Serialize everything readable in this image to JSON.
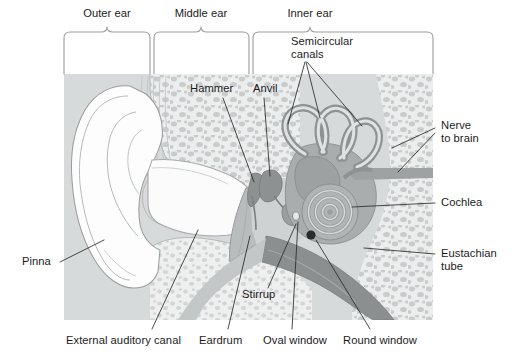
{
  "figure": {
    "background_color": "#ffffff",
    "panel_color": "#d9dcdc",
    "bone_color": "#e3e5e5",
    "tissue_color": "#a8abab",
    "dark_tissue_color": "#8f9393",
    "outline_color": "#8b8f8f",
    "leader_color": "#2b2b2b",
    "text_color": "#1b1b1b"
  },
  "section_brackets": [
    {
      "id": "outer-ear",
      "label": "Outer ear",
      "x_start": 64,
      "x_end": 150,
      "label_x": 107,
      "label_y": 14
    },
    {
      "id": "middle-ear",
      "label": "Middle ear",
      "x_start": 154,
      "x_end": 249,
      "label_x": 201,
      "label_y": 14
    },
    {
      "id": "inner-ear",
      "label": "Inner ear",
      "x_start": 253,
      "x_end": 433,
      "label_x": 310,
      "label_y": 14
    }
  ],
  "callouts": [
    {
      "id": "semicircular-canals",
      "label": "Semicircular\ncanals",
      "x": 291,
      "y": 41,
      "align": "left",
      "leaders": 3
    },
    {
      "id": "hammer",
      "label": "Hammer",
      "x": 190,
      "y": 88,
      "align": "left",
      "leaders": 1
    },
    {
      "id": "anvil",
      "label": "Anvil",
      "x": 253,
      "y": 88,
      "align": "left",
      "leaders": 1
    },
    {
      "id": "nerve-to-brain",
      "label": "Nerve\nto brain",
      "x": 439,
      "y": 125,
      "align": "left",
      "leaders": 2
    },
    {
      "id": "cochlea",
      "label": "Cochlea",
      "x": 439,
      "y": 198,
      "align": "left",
      "leaders": 1
    },
    {
      "id": "eustachian-tube",
      "label": "Eustachian\ntube",
      "x": 439,
      "y": 248,
      "align": "left",
      "leaders": 1
    },
    {
      "id": "pinna",
      "label": "Pinna",
      "x": 22,
      "y": 258,
      "align": "left",
      "leaders": 1
    },
    {
      "id": "stirrup",
      "label": "Stirrup",
      "x": 242,
      "y": 291,
      "align": "left",
      "leaders": 1
    },
    {
      "id": "external-auditory-canal",
      "label": "External auditory canal",
      "x": 66,
      "y": 337,
      "align": "left",
      "leaders": 1
    },
    {
      "id": "eardrum",
      "label": "Eardrum",
      "x": 197,
      "y": 337,
      "align": "left",
      "leaders": 1
    },
    {
      "id": "oval-window",
      "label": "Oval window",
      "x": 262,
      "y": 337,
      "align": "left",
      "leaders": 1
    },
    {
      "id": "round-window",
      "label": "Round window",
      "x": 342,
      "y": 337,
      "align": "left",
      "leaders": 1
    }
  ],
  "structures": [
    {
      "id": "pinna-outline",
      "name": "Pinna (auricle)"
    },
    {
      "id": "ear-canal",
      "name": "External auditory canal"
    },
    {
      "id": "eardrum-membrane",
      "name": "Eardrum (tympanic membrane)"
    },
    {
      "id": "ossicles",
      "name": "Hammer, anvil, stirrup"
    },
    {
      "id": "semicircular-canal-loops",
      "name": "Semicircular canals"
    },
    {
      "id": "cochlea-spiral",
      "name": "Cochlea"
    },
    {
      "id": "auditory-nerve",
      "name": "Nerve to brain"
    },
    {
      "id": "eustachian-tube-band",
      "name": "Eustachian tube"
    },
    {
      "id": "oval-window-mark",
      "name": "Oval window"
    },
    {
      "id": "round-window-mark",
      "name": "Round window"
    },
    {
      "id": "temporal-bone",
      "name": "Temporal bone (cancellous)"
    }
  ]
}
